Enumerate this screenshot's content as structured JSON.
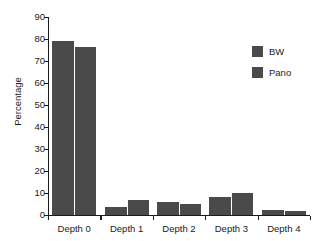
{
  "chart_data": {
    "type": "bar",
    "title": "",
    "subtitle": "",
    "xlabel": "",
    "ylabel": "Percentage",
    "categories": [
      "Depth 0",
      "Depth 1",
      "Depth 2",
      "Depth 3",
      "Depth 4"
    ],
    "series": [
      {
        "name": "BW",
        "color": "#4a4a4a",
        "values": [
          79.0,
          3.7,
          6.1,
          8.2,
          2.4
        ]
      },
      {
        "name": "Pano",
        "color": "#4a4a4a",
        "values": [
          76.5,
          6.7,
          4.9,
          9.8,
          1.9
        ]
      }
    ],
    "ylim": [
      0,
      90
    ],
    "ytick_step": 10,
    "ytick_labels": [
      "0",
      "10",
      "20",
      "30",
      "40",
      "50",
      "60",
      "70",
      "80",
      "90"
    ],
    "grid": false,
    "legend_position": "top-right",
    "axis_color": "#1a1a1a",
    "background_color": "#ffffff"
  }
}
